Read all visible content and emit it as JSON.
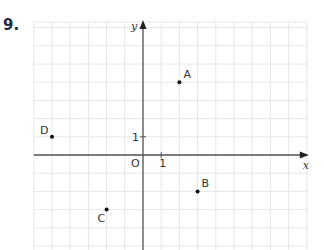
{
  "question": {
    "number": "9."
  },
  "grid": {
    "unit_px": 18.2,
    "origin_px": [
      143,
      155
    ],
    "x_range": [
      -6,
      9
    ],
    "y_range": [
      -5,
      7
    ],
    "grid_color": "#e6e6e6",
    "axis_color": "#555555"
  },
  "axes": {
    "x_label": "x",
    "y_label": "y",
    "origin_label": "O",
    "x_tick_label": "1",
    "y_tick_label": "1"
  },
  "points": [
    {
      "label": "A",
      "x": 2,
      "y": 4
    },
    {
      "label": "B",
      "x": 3,
      "y": -2
    },
    {
      "label": "C",
      "x": -2,
      "y": -3
    },
    {
      "label": "D",
      "x": -5,
      "y": 1
    }
  ],
  "chart_data": {
    "type": "scatter",
    "title": "9.",
    "xlabel": "x",
    "ylabel": "y",
    "xlim": [
      -6,
      9
    ],
    "ylim": [
      -5,
      7
    ],
    "grid": true,
    "tick_labels": {
      "x": [
        "1"
      ],
      "y": [
        "1"
      ],
      "origin": "O"
    },
    "series": [
      {
        "name": "points",
        "labels": [
          "A",
          "B",
          "C",
          "D"
        ],
        "x": [
          2,
          3,
          -2,
          -5
        ],
        "y": [
          4,
          -2,
          -3,
          1
        ]
      }
    ]
  }
}
